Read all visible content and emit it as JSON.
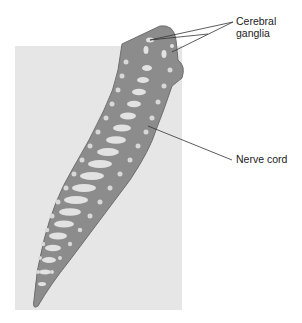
{
  "figure": {
    "labels": {
      "cerebral_ganglia_line1": "Cerebral",
      "cerebral_ganglia_line2": "ganglia",
      "nerve_cord": "Nerve cord"
    },
    "colors": {
      "background_panel": "#e6e6e6",
      "body": "#8c8c8c",
      "body_outline": "#6e6e6e",
      "organs": "#e2e2e2",
      "leader_line": "#333333"
    }
  }
}
